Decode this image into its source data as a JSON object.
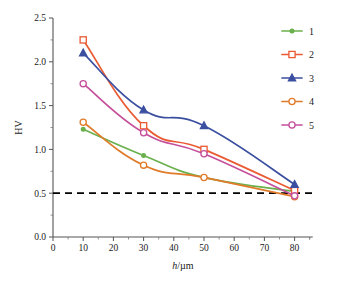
{
  "chart_data": {
    "type": "line",
    "title": "",
    "xlabel": "h/µm",
    "xlabel_italic_part": "h",
    "xlabel_rest": "/µm",
    "ylabel": "HV",
    "xlim": [
      0,
      86
    ],
    "ylim": [
      0.0,
      2.5
    ],
    "grid": false,
    "legend_position": "top-right",
    "x": [
      10,
      30,
      50,
      80
    ],
    "xticks": [
      0,
      10,
      20,
      30,
      40,
      50,
      60,
      70,
      80
    ],
    "xtick_labels": [
      "0",
      "10",
      "20",
      "30",
      "40",
      "50",
      "60",
      "70",
      "80"
    ],
    "yticks": [
      0.0,
      0.5,
      1.0,
      1.5,
      2.0,
      2.5
    ],
    "ytick_labels": [
      "0.0",
      "0.5",
      "1.0",
      "1.5",
      "2.0",
      "2.5"
    ],
    "series": [
      {
        "name": "1",
        "color": "#6ab04c",
        "marker": "dot",
        "values": [
          1.23,
          0.93,
          0.68,
          0.52
        ]
      },
      {
        "name": "2",
        "color": "#ea5a33",
        "marker": "square",
        "values": [
          2.25,
          1.27,
          1.0,
          0.53
        ]
      },
      {
        "name": "3",
        "color": "#3b4fa0",
        "marker": "triangle",
        "values": [
          2.1,
          1.45,
          1.27,
          0.6
        ]
      },
      {
        "name": "4",
        "color": "#e07b2a",
        "marker": "circle",
        "values": [
          1.31,
          0.82,
          0.68,
          0.46
        ]
      },
      {
        "name": "5",
        "color": "#c54f9b",
        "marker": "circle",
        "values": [
          1.75,
          1.19,
          0.95,
          0.47
        ]
      }
    ],
    "threshold": {
      "value": 0.5,
      "style": "dashed",
      "color": "#000000",
      "label": ""
    },
    "annotations": []
  },
  "legend": {
    "entries": [
      {
        "label": "1"
      },
      {
        "label": "2"
      },
      {
        "label": "3"
      },
      {
        "label": "4"
      },
      {
        "label": "5"
      }
    ]
  }
}
